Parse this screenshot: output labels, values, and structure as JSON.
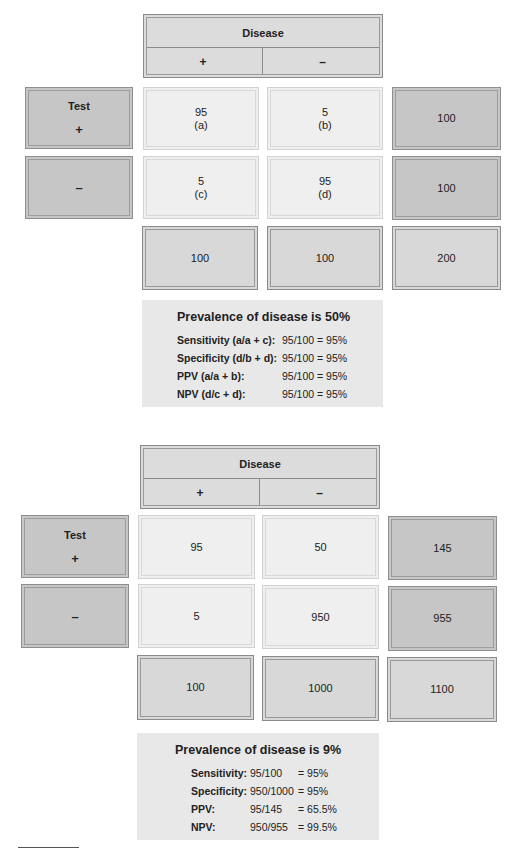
{
  "tables": [
    {
      "header": {
        "title": "Disease",
        "pos": "+",
        "neg": "–"
      },
      "rows": [
        {
          "label": "Test",
          "sign": "+",
          "cells": [
            {
              "value": "95",
              "tag": "(a)"
            },
            {
              "value": "5",
              "tag": "(b)"
            }
          ],
          "total": "100"
        },
        {
          "label": "",
          "sign": "–",
          "cells": [
            {
              "value": "5",
              "tag": "(c)"
            },
            {
              "value": "95",
              "tag": "(d)"
            }
          ],
          "total": "100"
        }
      ],
      "totals": [
        "100",
        "100",
        "200"
      ],
      "stats": {
        "title": "Prevalence of disease is 50%",
        "items": [
          {
            "label": "Sensitivity (a/a + c):",
            "value": "95/100 = 95%"
          },
          {
            "label": "Specificity (d/b + d):",
            "value": "95/100 = 95%"
          },
          {
            "label": "PPV (a/a + b):",
            "value": "95/100 = 95%"
          },
          {
            "label": "NPV (d/c + d):",
            "value": "95/100 = 95%"
          }
        ]
      }
    },
    {
      "header": {
        "title": "Disease",
        "pos": "+",
        "neg": "–"
      },
      "rows": [
        {
          "label": "Test",
          "sign": "+",
          "cells": [
            {
              "value": "95",
              "tag": ""
            },
            {
              "value": "50",
              "tag": ""
            }
          ],
          "total": "145"
        },
        {
          "label": "",
          "sign": "–",
          "cells": [
            {
              "value": "5",
              "tag": ""
            },
            {
              "value": "950",
              "tag": ""
            }
          ],
          "total": "955"
        }
      ],
      "totals": [
        "100",
        "1000",
        "1100"
      ],
      "stats": {
        "title": "Prevalence of disease is 9%",
        "items": [
          {
            "label": "Sensitivity:",
            "fraction": "95/100",
            "result": "= 95%"
          },
          {
            "label": "Specificity:",
            "fraction": "950/1000",
            "result": "= 95%"
          },
          {
            "label": "PPV:",
            "fraction": "95/145",
            "result": "= 65.5%"
          },
          {
            "label": "NPV:",
            "fraction": "950/955",
            "result": "= 99.5%"
          }
        ]
      }
    }
  ]
}
